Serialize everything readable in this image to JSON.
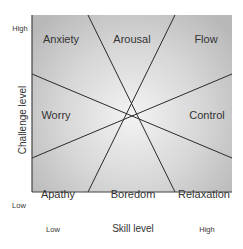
{
  "diagram": {
    "type": "flow-model-quadrants",
    "x_axis": {
      "title": "Skill level",
      "low": "Low",
      "high": "High"
    },
    "y_axis": {
      "title": "Challenge level",
      "low": "Low",
      "high": "High"
    },
    "regions": [
      {
        "name": "Anxiety",
        "position": "top-left"
      },
      {
        "name": "Arousal",
        "position": "top-center"
      },
      {
        "name": "Flow",
        "position": "top-right"
      },
      {
        "name": "Worry",
        "position": "middle-left"
      },
      {
        "name": "Control",
        "position": "middle-right"
      },
      {
        "name": "Apathy",
        "position": "bottom-left"
      },
      {
        "name": "Boredom",
        "position": "bottom-center"
      },
      {
        "name": "Relaxation",
        "position": "bottom-right"
      }
    ],
    "colors": {
      "background_center": "#f2f2f2",
      "background_edge": "#bdbdbd",
      "lines": "#2a2a2a"
    }
  }
}
